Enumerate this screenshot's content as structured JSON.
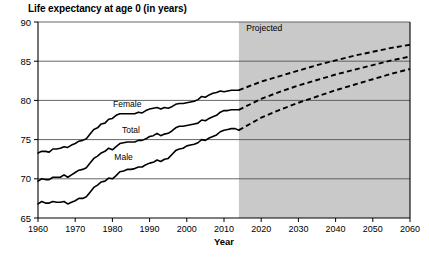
{
  "chart_data": {
    "type": "line",
    "title": "Life expectancy at age 0 (in years)",
    "xlabel": "Year",
    "ylabel": "",
    "xlim": [
      1960,
      2060
    ],
    "ylim": [
      65,
      90
    ],
    "xticks": [
      1960,
      1970,
      1980,
      1990,
      2000,
      2010,
      2020,
      2030,
      2040,
      2050,
      2060
    ],
    "yticks": [
      65,
      70,
      75,
      80,
      85,
      90
    ],
    "grid": "horizontal",
    "legend": "inline-labels",
    "annotations": [
      {
        "text": "Projected",
        "x": 2016,
        "y": 88.8,
        "role": "shaded-region-label"
      }
    ],
    "shaded_region": {
      "label": "Projected",
      "x_start": 2014,
      "x_end": 2060,
      "color": "#c9c9c9"
    },
    "line_color": "#000000",
    "historical_style": "solid",
    "projected_style": "dashed",
    "series": [
      {
        "name": "Female",
        "label_x": 1984,
        "label_y": 79.1,
        "historical": {
          "x": [
            1960,
            1961,
            1962,
            1963,
            1964,
            1965,
            1966,
            1967,
            1968,
            1969,
            1970,
            1971,
            1972,
            1973,
            1974,
            1975,
            1976,
            1977,
            1978,
            1979,
            1980,
            1981,
            1982,
            1983,
            1984,
            1985,
            1986,
            1987,
            1988,
            1989,
            1990,
            1991,
            1992,
            1993,
            1994,
            1995,
            1996,
            1997,
            1998,
            1999,
            2000,
            2001,
            2002,
            2003,
            2004,
            2005,
            2006,
            2007,
            2008,
            2009,
            2010,
            2011,
            2012,
            2013,
            2014
          ],
          "y": [
            73.3,
            73.5,
            73.5,
            73.4,
            73.8,
            73.8,
            73.9,
            74.1,
            74.0,
            74.3,
            74.5,
            74.8,
            74.9,
            75.1,
            75.7,
            76.3,
            76.5,
            77.0,
            77.1,
            77.6,
            77.7,
            78.1,
            78.3,
            78.3,
            78.3,
            78.3,
            78.3,
            78.5,
            78.4,
            78.7,
            78.9,
            79.0,
            79.1,
            78.9,
            79.1,
            79.0,
            79.2,
            79.5,
            79.6,
            79.6,
            79.7,
            79.8,
            79.9,
            80.1,
            80.5,
            80.4,
            80.7,
            80.9,
            81.0,
            81.2,
            81.1,
            81.2,
            81.3,
            81.3,
            81.3
          ]
        },
        "projected": {
          "x": [
            2014,
            2020,
            2025,
            2030,
            2035,
            2040,
            2045,
            2050,
            2055,
            2060
          ],
          "y": [
            81.3,
            82.4,
            83.1,
            83.8,
            84.5,
            85.1,
            85.7,
            86.2,
            86.7,
            87.1
          ]
        }
      },
      {
        "name": "Total",
        "label_x": 1985,
        "label_y": 75.8,
        "historical": {
          "x": [
            1960,
            1961,
            1962,
            1963,
            1964,
            1965,
            1966,
            1967,
            1968,
            1969,
            1970,
            1971,
            1972,
            1973,
            1974,
            1975,
            1976,
            1977,
            1978,
            1979,
            1980,
            1981,
            1982,
            1983,
            1984,
            1985,
            1986,
            1987,
            1988,
            1989,
            1990,
            1991,
            1992,
            1993,
            1994,
            1995,
            1996,
            1997,
            1998,
            1999,
            2000,
            2001,
            2002,
            2003,
            2004,
            2005,
            2006,
            2007,
            2008,
            2009,
            2010,
            2011,
            2012,
            2013,
            2014
          ],
          "y": [
            69.7,
            70.0,
            69.9,
            69.9,
            70.2,
            70.2,
            70.2,
            70.5,
            70.2,
            70.5,
            70.8,
            71.1,
            71.2,
            71.4,
            72.0,
            72.6,
            72.9,
            73.3,
            73.5,
            73.9,
            73.7,
            74.1,
            74.5,
            74.6,
            74.7,
            74.7,
            74.7,
            74.9,
            74.9,
            75.1,
            75.4,
            75.5,
            75.8,
            75.5,
            75.7,
            75.8,
            76.1,
            76.5,
            76.7,
            76.7,
            76.8,
            76.9,
            77.0,
            77.1,
            77.5,
            77.4,
            77.7,
            77.9,
            78.1,
            78.5,
            78.7,
            78.7,
            78.8,
            78.8,
            78.8
          ]
        },
        "projected": {
          "x": [
            2014,
            2020,
            2025,
            2030,
            2035,
            2040,
            2045,
            2050,
            2055,
            2060
          ],
          "y": [
            78.8,
            80.2,
            81.1,
            81.9,
            82.6,
            83.3,
            83.9,
            84.5,
            85.1,
            85.6
          ]
        }
      },
      {
        "name": "Male",
        "label_x": 1983,
        "label_y": 72.4,
        "historical": {
          "x": [
            1960,
            1961,
            1962,
            1963,
            1964,
            1965,
            1966,
            1967,
            1968,
            1969,
            1970,
            1971,
            1972,
            1973,
            1974,
            1975,
            1976,
            1977,
            1978,
            1979,
            1980,
            1981,
            1982,
            1983,
            1984,
            1985,
            1986,
            1987,
            1988,
            1989,
            1990,
            1991,
            1992,
            1993,
            1994,
            1995,
            1996,
            1997,
            1998,
            1999,
            2000,
            2001,
            2002,
            2003,
            2004,
            2005,
            2006,
            2007,
            2008,
            2009,
            2010,
            2011,
            2012,
            2013,
            2014
          ],
          "y": [
            66.8,
            67.1,
            66.9,
            66.9,
            67.1,
            67.0,
            67.0,
            67.1,
            66.8,
            67.0,
            67.2,
            67.5,
            67.5,
            67.7,
            68.3,
            68.9,
            69.2,
            69.6,
            69.7,
            70.1,
            70.0,
            70.4,
            70.9,
            71.0,
            71.2,
            71.2,
            71.3,
            71.5,
            71.5,
            71.8,
            72.0,
            72.1,
            72.4,
            72.2,
            72.5,
            72.6,
            73.1,
            73.6,
            73.8,
            73.9,
            74.2,
            74.3,
            74.4,
            74.6,
            75.0,
            74.9,
            75.2,
            75.4,
            75.6,
            76.0,
            76.2,
            76.3,
            76.4,
            76.4,
            76.2
          ]
        },
        "projected": {
          "x": [
            2014,
            2020,
            2025,
            2030,
            2035,
            2040,
            2045,
            2050,
            2055,
            2060
          ],
          "y": [
            76.2,
            77.8,
            78.8,
            79.7,
            80.5,
            81.3,
            82.0,
            82.7,
            83.4,
            84.0
          ]
        }
      }
    ]
  }
}
